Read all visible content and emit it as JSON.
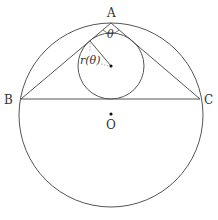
{
  "diagram": {
    "type": "geometry",
    "colors": {
      "stroke": "#555555",
      "text": "#333333",
      "point": "#111111"
    },
    "points": {
      "A": {
        "label": "A",
        "x": 111,
        "y": 23
      },
      "B": {
        "label": "B",
        "x": 21,
        "y": 99
      },
      "C": {
        "label": "C",
        "x": 200,
        "y": 99
      },
      "O": {
        "label": "O",
        "x": 111,
        "y": 114
      },
      "I": {
        "label": "",
        "x": 111,
        "y": 66
      }
    },
    "circumcircle": {
      "cx": 111,
      "cy": 115,
      "r": 92
    },
    "incircle": {
      "cx": 111,
      "cy": 66,
      "r": 33
    },
    "angle_label": "θ",
    "radius_label": "r(θ)"
  }
}
